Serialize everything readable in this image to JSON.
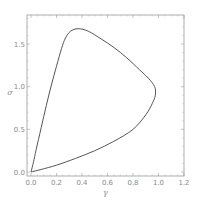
{
  "chart_data": {
    "type": "line",
    "title": "",
    "xlabel": "γ",
    "ylabel": "σ",
    "xlim": [
      -0.03,
      1.22
    ],
    "ylim": [
      -0.03,
      1.85
    ],
    "grid": false,
    "legend": null,
    "x_ticks": [
      "0.0",
      "0.2",
      "0.4",
      "0.6",
      "0.8",
      "1.0",
      "1.2"
    ],
    "y_ticks": [
      "0.0",
      "0.5",
      "1.0",
      "1.5"
    ],
    "series": [
      {
        "name": "closed curve",
        "color": "#555555",
        "points": [
          [
            0.0,
            0.0
          ],
          [
            0.02,
            0.12
          ],
          [
            0.04,
            0.26
          ],
          [
            0.08,
            0.52
          ],
          [
            0.12,
            0.78
          ],
          [
            0.16,
            1.02
          ],
          [
            0.2,
            1.24
          ],
          [
            0.24,
            1.45
          ],
          [
            0.27,
            1.57
          ],
          [
            0.31,
            1.65
          ],
          [
            0.37,
            1.68
          ],
          [
            0.45,
            1.65
          ],
          [
            0.55,
            1.56
          ],
          [
            0.65,
            1.46
          ],
          [
            0.75,
            1.34
          ],
          [
            0.85,
            1.2
          ],
          [
            0.92,
            1.1
          ],
          [
            0.97,
            1.0
          ],
          [
            0.975,
            0.9
          ],
          [
            0.95,
            0.8
          ],
          [
            0.9,
            0.67
          ],
          [
            0.8,
            0.5
          ],
          [
            0.65,
            0.36
          ],
          [
            0.5,
            0.25
          ],
          [
            0.35,
            0.16
          ],
          [
            0.2,
            0.08
          ],
          [
            0.08,
            0.03
          ],
          [
            0.0,
            0.0
          ]
        ]
      }
    ]
  },
  "plot": {
    "frame": {
      "left": 27,
      "top": 15,
      "right": 184,
      "bottom": 176
    },
    "origin_px": [
      31,
      172
    ],
    "x_px_per_unit": 127.5,
    "y_px_per_unit": 85.3
  }
}
